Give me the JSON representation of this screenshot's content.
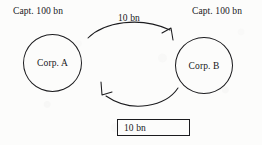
{
  "figure": {
    "background_color": "#fcfcfb",
    "ink_color": "#17171a"
  },
  "nodes": [
    {
      "id": "corp-a",
      "label": "Corp. A",
      "capital_label": "Capt. 100 bn"
    },
    {
      "id": "corp-b",
      "label": "Corp. B",
      "capital_label": "Capt. 100 bn"
    }
  ],
  "flows": [
    {
      "id": "flow-a-to-b",
      "amount": "10 bn",
      "from": "Corp. A",
      "to": "Corp. B",
      "style": "curved-arrow-above",
      "boxed": false
    },
    {
      "id": "flow-b-to-a",
      "amount": "10 bn",
      "from": "Corp. B",
      "to": "Corp. A",
      "style": "curved-arrow-below",
      "boxed": true
    }
  ]
}
